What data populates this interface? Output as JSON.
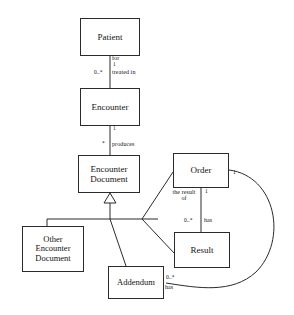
{
  "diagram": {
    "type": "uml-class-diagram",
    "background_color": "#ffffff",
    "line_color": "#2b2b2b",
    "text_color": "#141414",
    "classes": [
      {
        "id": "patient",
        "name": "Patient",
        "x": 80,
        "y": 18,
        "w": 60,
        "h": 38,
        "font_size": 9
      },
      {
        "id": "encounter",
        "name": "Encounter",
        "x": 80,
        "y": 88,
        "w": 60,
        "h": 38,
        "font_size": 9
      },
      {
        "id": "encdoc",
        "name": "Encounter\nDocument",
        "x": 78,
        "y": 155,
        "w": 62,
        "h": 38,
        "font_size": 9
      },
      {
        "id": "otherdoc",
        "name": "Other\nEncounter\nDocument",
        "x": 22,
        "y": 226,
        "w": 62,
        "h": 46,
        "font_size": 8.5
      },
      {
        "id": "addendum",
        "name": "Addendum",
        "x": 108,
        "y": 266,
        "w": 56,
        "h": 33,
        "font_size": 8.5
      },
      {
        "id": "order",
        "name": "Order",
        "x": 173,
        "y": 153,
        "w": 56,
        "h": 35,
        "font_size": 9
      },
      {
        "id": "result",
        "name": "Result",
        "x": 174,
        "y": 232,
        "w": 56,
        "h": 36,
        "font_size": 9
      }
    ],
    "edge_labels": [
      {
        "id": "for",
        "text": "for",
        "x": 106,
        "y": 56,
        "kind": "role"
      },
      {
        "id": "patient-mult",
        "text": "1",
        "x": 109,
        "y": 64,
        "kind": "mult"
      },
      {
        "id": "enc-mult",
        "text": "0..*",
        "x": 92,
        "y": 72,
        "kind": "mult"
      },
      {
        "id": "treated-in",
        "text": "treated in",
        "x": 108,
        "y": 71,
        "kind": "role"
      },
      {
        "id": "enc-one",
        "text": "1",
        "x": 110,
        "y": 128,
        "kind": "mult"
      },
      {
        "id": "doc-mult",
        "text": "*",
        "x": 101,
        "y": 143,
        "kind": "mult"
      },
      {
        "id": "produces",
        "text": "produces",
        "x": 108,
        "y": 142,
        "kind": "role"
      },
      {
        "id": "the-result-of",
        "text": "the result\nof",
        "x": 167,
        "y": 190,
        "kind": "role"
      },
      {
        "id": "order-one",
        "text": "1",
        "x": 206,
        "y": 190,
        "kind": "mult"
      },
      {
        "id": "result-mult",
        "text": "0..*",
        "x": 184,
        "y": 219,
        "kind": "mult"
      },
      {
        "id": "has-result",
        "text": "has",
        "x": 203,
        "y": 219,
        "kind": "role"
      },
      {
        "id": "order-right-one",
        "text": "1",
        "x": 233,
        "y": 172,
        "kind": "mult"
      },
      {
        "id": "addendum-mult",
        "text": "0..*",
        "x": 166,
        "y": 277,
        "kind": "mult"
      },
      {
        "id": "has-addendum",
        "text": "has",
        "x": 166,
        "y": 287,
        "kind": "role"
      }
    ],
    "relationships": [
      {
        "id": "patient-encounter",
        "from": "patient",
        "to": "encounter",
        "type": "association",
        "role": "treated in",
        "source_mult": "1",
        "target_mult": "0..*"
      },
      {
        "id": "encounter-encdoc",
        "from": "encounter",
        "to": "encdoc",
        "type": "association",
        "role": "produces",
        "source_mult": "1",
        "target_mult": "*"
      },
      {
        "id": "otherdoc-encdoc",
        "from": "otherdoc",
        "to": "encdoc",
        "type": "generalization",
        "role": "",
        "source_mult": "",
        "target_mult": ""
      },
      {
        "id": "addendum-encdoc",
        "from": "addendum",
        "to": "encdoc",
        "type": "generalization",
        "role": "",
        "source_mult": "",
        "target_mult": ""
      },
      {
        "id": "result-encdoc",
        "from": "result",
        "to": "encdoc",
        "type": "generalization",
        "role": "",
        "source_mult": "",
        "target_mult": ""
      },
      {
        "id": "order-encdoc",
        "from": "order",
        "to": "encdoc",
        "type": "generalization",
        "role": "",
        "source_mult": "",
        "target_mult": ""
      },
      {
        "id": "order-result",
        "from": "order",
        "to": "result",
        "type": "association",
        "role": "has",
        "source_mult": "1",
        "target_mult": "0..*"
      },
      {
        "id": "order-addendum",
        "from": "order",
        "to": "addendum",
        "type": "association",
        "role": "has",
        "source_mult": "1",
        "target_mult": "0..*"
      }
    ]
  }
}
